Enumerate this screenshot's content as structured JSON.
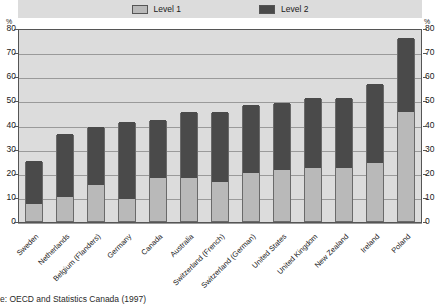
{
  "chart_data": {
    "type": "bar",
    "stacked": true,
    "title": "",
    "subtitle": "",
    "xlabel": "",
    "ylabel": "%",
    "ylim": [
      0,
      80
    ],
    "yticks": [
      0,
      10,
      20,
      30,
      40,
      50,
      60,
      70,
      80
    ],
    "grid": true,
    "legend_position": "top-center",
    "axis_unit_left": "%",
    "axis_unit_right": "%",
    "categories": [
      "Sweden",
      "Netherlands",
      "Belgium (Flanders)",
      "Germany",
      "Canada",
      "Australia",
      "Switzerland (French)",
      "Switzerland (German)",
      "United States",
      "United Kingdom",
      "New Zealand",
      "Ireland",
      "Poland"
    ],
    "series": [
      {
        "name": "Level 1",
        "color": "#b9b9b9",
        "values": [
          7,
          10,
          15,
          9,
          18,
          18,
          16,
          20,
          21,
          22,
          22,
          24,
          45
        ]
      },
      {
        "name": "Level 2",
        "color": "#4a4a4a",
        "values": [
          18,
          26,
          24,
          32,
          24,
          27,
          29,
          28,
          28,
          29,
          29,
          33,
          31
        ]
      }
    ],
    "totals": [
      25,
      36,
      39,
      41,
      42,
      45,
      45,
      48,
      49,
      51,
      51,
      57,
      76
    ],
    "source": "Source: OECD and Statistics Canada (1997)."
  },
  "legend": {
    "items": [
      {
        "label": "Level 1",
        "swatch": "light-gray"
      },
      {
        "label": "Level 2",
        "swatch": "dark-gray"
      }
    ]
  },
  "source_text": "e: OECD and Statistics Canada (1997)",
  "colors": {
    "level1": "#b9b9b9",
    "level2": "#4a4a4a",
    "plot_background": "#dcdcdc",
    "gridline": "#9a9a9a",
    "axis": "#555555"
  }
}
